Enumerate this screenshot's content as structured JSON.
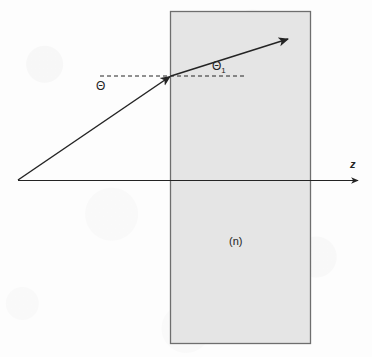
{
  "figure": {
    "type": "optics-ray-diagram",
    "background_color": "#fdfdfd",
    "ink_color": "#242424",
    "labels": {
      "incident_angle": "Θ",
      "refracted_angle_base": "Θ",
      "refracted_angle_sub": "1",
      "refracted_angle_full": "Θ1",
      "axis_z": "z",
      "medium_index": "(n)"
    },
    "slab": {
      "name": "dielectric-slab",
      "fill_color": "#e5e5e5",
      "stroke_color": "#6e6e6e",
      "x": 170,
      "y": 11,
      "width": 141,
      "height": 333,
      "left_interface_x": 170,
      "right_interface_x": 311
    },
    "optical_axis": {
      "name": "z-axis",
      "from_x": 18,
      "from_y": 180,
      "to_x": 360,
      "to_y": 180,
      "arrow": "right"
    },
    "incident_ray": {
      "name": "incident-ray",
      "from_x": 18,
      "from_y": 180,
      "to_x": 171,
      "to_y": 76,
      "arrow": "end"
    },
    "refracted_ray": {
      "name": "refracted-ray",
      "from_x": 171,
      "from_y": 76,
      "to_x": 291,
      "to_y": 38,
      "arrow": "end"
    },
    "reference_dashed_line": {
      "name": "horizontal-reference-line",
      "from_x": 100,
      "from_y": 76,
      "to_x": 245,
      "to_y": 76,
      "dash": "4 3"
    },
    "incidence_point": {
      "x": 171,
      "y": 76
    }
  }
}
